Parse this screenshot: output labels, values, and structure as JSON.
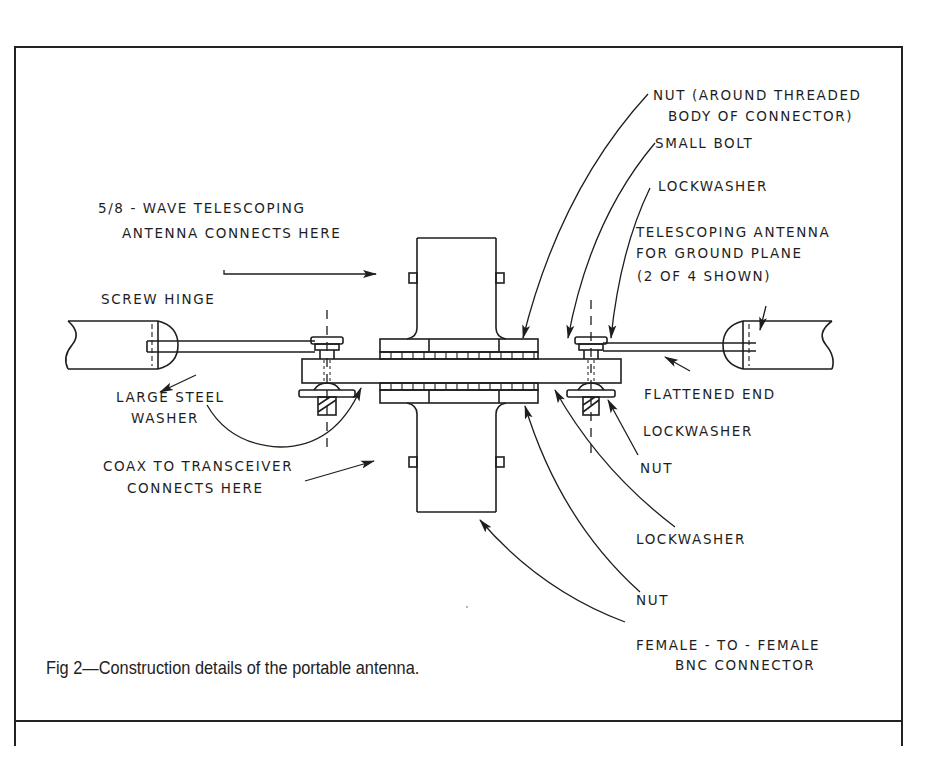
{
  "figure": {
    "caption": "Fig 2—Construction details of the portable antenna.",
    "labels": {
      "nut_threaded_1": "NUT (AROUND THREADED",
      "nut_threaded_2": "BODY OF CONNECTOR)",
      "small_bolt": "SMALL BOLT",
      "lockwasher_top": "LOCKWASHER",
      "telescoping_gp_1": "TELESCOPING ANTENNA",
      "telescoping_gp_2": "FOR GROUND PLANE",
      "telescoping_gp_3": "(2 OF 4 SHOWN)",
      "wave_antenna_1": "5/8 - WAVE TELESCOPING",
      "wave_antenna_2": "ANTENNA CONNECTS HERE",
      "screw_hinge": "SCREW HINGE",
      "large_washer_1": "LARGE STEEL",
      "large_washer_2": "WASHER",
      "coax_1": "COAX TO TRANSCEIVER",
      "coax_2": "CONNECTS HERE",
      "flattened_end": "FLATTENED END",
      "lockwasher_right": "LOCKWASHER",
      "nut_right": "NUT",
      "lockwasher_lower": "LOCKWASHER",
      "nut_lower": "NUT",
      "bnc_1": "FEMALE - TO -  FEMALE",
      "bnc_2": "BNC CONNECTOR"
    }
  },
  "colors": {
    "ink": "#1e1e1e",
    "paper": "#ffffff"
  }
}
